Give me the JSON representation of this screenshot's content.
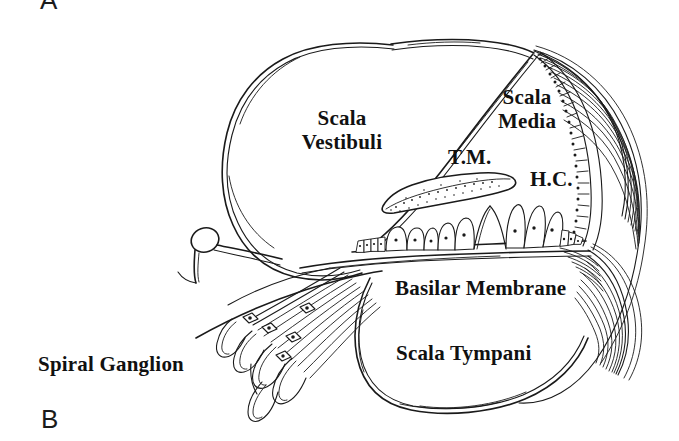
{
  "figure": {
    "panel_letters": [
      {
        "id": "panel-letter-a",
        "text": "A",
        "x": 40,
        "y": -13
      },
      {
        "id": "panel-letter-b",
        "text": "B",
        "x": 41,
        "y": 406
      }
    ],
    "labels": [
      {
        "id": "label-scala-vestibuli",
        "line1": "Scala",
        "line2": "Vestibuli",
        "x": 292,
        "y": 106,
        "size": 21
      },
      {
        "id": "label-scala-media",
        "line1": "Scala",
        "line2": "Media",
        "x": 487,
        "y": 85,
        "size": 21
      },
      {
        "id": "label-tectorial-membrane",
        "line1": "T.M.",
        "line2": "",
        "x": 448,
        "y": 145,
        "size": 21
      },
      {
        "id": "label-hair-cells",
        "line1": "H.C.",
        "line2": "",
        "x": 530,
        "y": 167,
        "size": 21
      },
      {
        "id": "label-basilar-membrane",
        "line1": "Basilar Membrane",
        "line2": "",
        "x": 395,
        "y": 276,
        "size": 21
      },
      {
        "id": "label-scala-tympani",
        "line1": "Scala Tympani",
        "line2": "",
        "x": 396,
        "y": 341,
        "size": 21
      },
      {
        "id": "label-spiral-ganglion",
        "line1": "Spiral Ganglion",
        "line2": "",
        "x": 38,
        "y": 352,
        "size": 21
      }
    ],
    "colors": {
      "ink": "#1a1a1a",
      "background": "#ffffff"
    },
    "caption_parts": {
      "scala_vestibuli": "Scala Vestibuli",
      "scala_media": "Scala Media",
      "tectorial_membrane": "T.M.",
      "hair_cells": "H.C.",
      "basilar_membrane": "Basilar Membrane",
      "scala_tympani": "Scala Tympani",
      "spiral_ganglion": "Spiral Ganglion"
    }
  }
}
